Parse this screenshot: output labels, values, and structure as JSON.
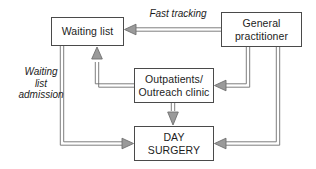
{
  "diagram": {
    "canvas": {
      "width": 316,
      "height": 169,
      "background": "#ffffff"
    },
    "style": {
      "node_border_color": "#4a4a4a",
      "node_fill_color": "#ffffff",
      "connector_color": "#6f6f6f",
      "text_color": "#1c1c1c"
    },
    "nodes": [
      {
        "id": "waiting-list",
        "label": "Waiting list",
        "x": 51,
        "y": 17,
        "width": 73,
        "height": 29
      },
      {
        "id": "general-practitioner",
        "label": "General\npractitioner",
        "x": 221,
        "y": 12,
        "width": 81,
        "height": 35
      },
      {
        "id": "outpatients",
        "label": "Outpatients/\nOutreach clinic",
        "x": 134,
        "y": 68,
        "width": 80,
        "height": 35
      },
      {
        "id": "day-surgery",
        "label": "DAY\nSURGERY",
        "x": 134,
        "y": 126,
        "width": 80,
        "height": 35
      }
    ],
    "edge_labels": [
      {
        "id": "fast-tracking",
        "text": "Fast tracking",
        "x": 134,
        "y": 8,
        "width": 88,
        "describes": "general-practitioner to waiting-list"
      },
      {
        "id": "waiting-list-admission",
        "text": "Waiting\nlist\nadmission",
        "x": 8,
        "y": 66,
        "width": 66,
        "describes": "waiting-list to day-surgery"
      }
    ],
    "edges": [
      {
        "id": "gp-to-waiting-list",
        "from": "general-practitioner",
        "to": "waiting-list",
        "label": "Fast tracking",
        "style": "outlined-arrow"
      },
      {
        "id": "gp-to-outpatients",
        "from": "general-practitioner",
        "to": "outpatients",
        "label": "",
        "style": "outlined-arrow"
      },
      {
        "id": "gp-to-day-surgery",
        "from": "general-practitioner",
        "to": "day-surgery",
        "label": "",
        "style": "outlined-arrow"
      },
      {
        "id": "outpatients-to-waiting-list",
        "from": "outpatients",
        "to": "waiting-list",
        "label": "",
        "style": "outlined-arrow"
      },
      {
        "id": "outpatients-to-day-surgery",
        "from": "outpatients",
        "to": "day-surgery",
        "label": "",
        "style": "outlined-arrow"
      },
      {
        "id": "waiting-list-to-day-surgery",
        "from": "waiting-list",
        "to": "day-surgery",
        "label": "Waiting list admission",
        "style": "outlined-arrow"
      }
    ]
  }
}
